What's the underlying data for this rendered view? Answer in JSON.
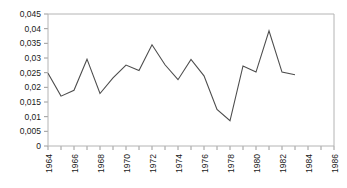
{
  "chart_data": {
    "type": "line",
    "title": "",
    "subtitle": "",
    "xlabel": "",
    "ylabel": "",
    "decimal_separator": ",",
    "grid": false,
    "legend": null,
    "line_color": "#4d4d4d",
    "frame_color": "#b4b4b4",
    "background_color": "#ffffff",
    "xlim": [
      1964,
      1986
    ],
    "ylim": [
      0,
      0.045
    ],
    "x_tick_interval": 1,
    "x_labeled_interval": 2,
    "y_tick_values": [
      0,
      0.005,
      0.01,
      0.015,
      0.02,
      0.025,
      0.03,
      0.035,
      0.04,
      0.045
    ],
    "y_tick_labels": [
      "0",
      "0,005",
      "0,01",
      "0,015",
      "0,02",
      "0,025",
      "0,03",
      "0,035",
      "0,04",
      "0,045"
    ],
    "x_tick_values": [
      1964,
      1965,
      1966,
      1967,
      1968,
      1969,
      1970,
      1971,
      1972,
      1973,
      1974,
      1975,
      1976,
      1977,
      1978,
      1979,
      1980,
      1981,
      1982,
      1983,
      1984,
      1985,
      1986
    ],
    "x_tick_labels": [
      "1964",
      "",
      "1966",
      "",
      "1968",
      "",
      "1970",
      "",
      "1972",
      "",
      "1974",
      "",
      "1976",
      "",
      "1978",
      "",
      "1980",
      "",
      "1982",
      "",
      "1984",
      "",
      "1986"
    ],
    "x": [
      1964,
      1965,
      1966,
      1967,
      1968,
      1969,
      1970,
      1971,
      1972,
      1973,
      1974,
      1975,
      1976,
      1977,
      1978,
      1979,
      1980,
      1981,
      1982,
      1983
    ],
    "values": [
      0.0248,
      0.017,
      0.019,
      0.0296,
      0.0179,
      0.0232,
      0.0276,
      0.0257,
      0.0345,
      0.0277,
      0.0226,
      0.0295,
      0.0239,
      0.0125,
      0.0086,
      0.0273,
      0.0252,
      0.0393,
      0.0252,
      0.0243
    ]
  }
}
